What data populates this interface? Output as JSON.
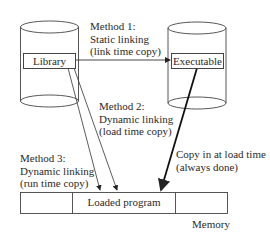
{
  "diagram": {
    "nodes": {
      "library": "Library",
      "executable": "Executable",
      "loaded_program": "Loaded program",
      "memory": "Memory"
    },
    "method1": {
      "line1": "Method 1:",
      "line2": "Static linking",
      "line3": "(link time copy)"
    },
    "method2": {
      "line1": "Method 2:",
      "line2": "Dynamic linking",
      "line3": "(load time copy)"
    },
    "method3": {
      "line1": "Method 3:",
      "line2": "Dynamic linking",
      "line3": "(run time copy)"
    },
    "load_copy": {
      "line1": "Copy in at load time",
      "line2": "(always done)"
    },
    "edges": [
      {
        "from": "library",
        "to": "executable",
        "label": "Method 1: Static linking (link time copy)"
      },
      {
        "from": "library",
        "to": "loaded_program",
        "label": "Method 2: Dynamic linking (load time copy)"
      },
      {
        "from": "library",
        "to": "loaded_program",
        "label": "Method 3: Dynamic linking (run time copy)"
      },
      {
        "from": "executable",
        "to": "loaded_program",
        "label": "Copy in at load time (always done)"
      }
    ]
  }
}
